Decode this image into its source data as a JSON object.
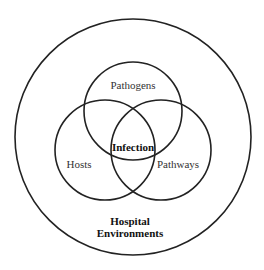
{
  "diagram": {
    "type": "nested-venn",
    "outer_set": {
      "id": "hospital-environments",
      "label_lines": [
        "Hospital",
        "Environments"
      ]
    },
    "sets": [
      {
        "id": "pathogens",
        "label": "Pathogens"
      },
      {
        "id": "hosts",
        "label": "Hosts"
      },
      {
        "id": "pathways",
        "label": "Pathways"
      }
    ],
    "intersection": {
      "id": "infection",
      "label": "Infection",
      "members": [
        "pathogens",
        "hosts",
        "pathways"
      ]
    },
    "colors": {
      "stroke": "#222222",
      "text": "#333333",
      "background": "#ffffff"
    }
  }
}
